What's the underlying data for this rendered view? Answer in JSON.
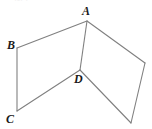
{
  "figure": {
    "type": "geometry-diagram",
    "background_color": "#ffffff",
    "stroke_color": "#808080",
    "stroke_width": 1.1,
    "label_color": "#1a1a1a",
    "canvas": {
      "width": 152,
      "height": 129
    },
    "vertices": [
      {
        "id": "A",
        "label": "A",
        "x": 87,
        "y": 21,
        "label_x": 82,
        "label_y": 5
      },
      {
        "id": "B",
        "label": "B",
        "x": 17,
        "y": 48,
        "label_x": 7,
        "label_y": 39
      },
      {
        "id": "C",
        "label": "C",
        "x": 17,
        "y": 111,
        "label_x": 6,
        "label_y": 113
      },
      {
        "id": "D",
        "label": "D",
        "x": 80,
        "y": 70,
        "label_x": 74,
        "label_y": 73
      },
      {
        "id": "E",
        "label": "",
        "x": 145,
        "y": 63,
        "label_x": 0,
        "label_y": 0
      },
      {
        "id": "F",
        "label": "",
        "x": 131,
        "y": 123,
        "label_x": 0,
        "label_y": 0
      }
    ],
    "edges": [
      {
        "from": "A",
        "to": "B"
      },
      {
        "from": "B",
        "to": "C"
      },
      {
        "from": "C",
        "to": "D"
      },
      {
        "from": "D",
        "to": "A"
      },
      {
        "from": "A",
        "to": "E"
      },
      {
        "from": "E",
        "to": "F"
      },
      {
        "from": "F",
        "to": "D"
      }
    ],
    "polygons": [
      {
        "name": "left-quadrilateral",
        "points": "87,21 17,48 17,111 80,70"
      },
      {
        "name": "right-quadrilateral",
        "points": "87,21 145,63 131,123 80,70"
      }
    ],
    "artifact_text": "·-· ·"
  }
}
